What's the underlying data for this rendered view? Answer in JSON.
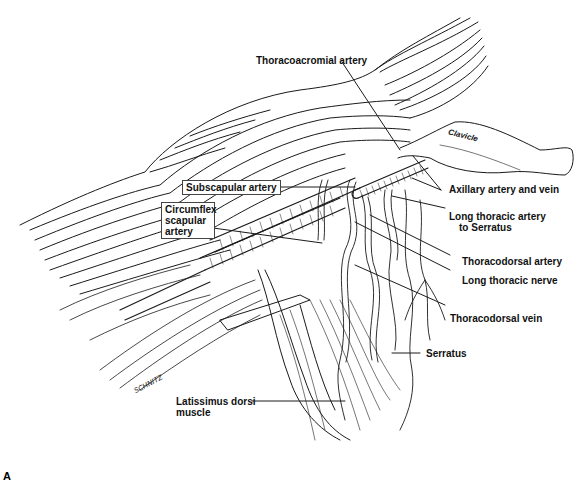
{
  "figure": {
    "panel_letter": "A",
    "signature": "SCHNITZ",
    "labels": {
      "thoracoacromial_artery": "Thoracoacromial artery",
      "clavicle": "Clavicle",
      "subscapular_artery": "Subscapular artery",
      "axillary_artery_and_vein": "Axillary artery and vein",
      "circumflex_scapular_artery_1": "Circumflex",
      "circumflex_scapular_artery_2": "scapular",
      "circumflex_scapular_artery_3": "artery",
      "long_thoracic_artery_1": "Long thoracic artery",
      "long_thoracic_artery_2": "to Serratus",
      "thoracodorsal_artery": "Thoracodorsal artery",
      "long_thoracic_nerve": "Long thoracic nerve",
      "thoracodorsal_vein": "Thoracodorsal vein",
      "serratus": "Serratus",
      "latissimus_dorsi_1": "Latissimus dorsi",
      "latissimus_dorsi_2": "muscle"
    },
    "colors": {
      "line": "#1a1a1a",
      "background": "#ffffff"
    }
  }
}
